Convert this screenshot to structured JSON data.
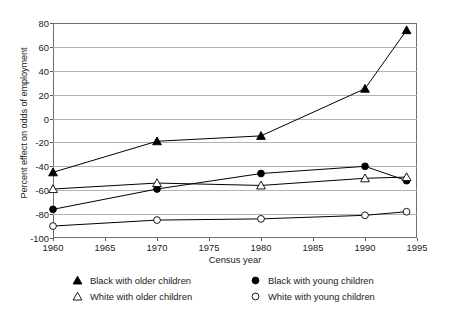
{
  "chart_data": {
    "type": "line",
    "title": "",
    "xlabel": "Census year",
    "ylabel": "Percent effect on odds of employment",
    "xlim": [
      1960,
      1995
    ],
    "ylim": [
      -100,
      80
    ],
    "xticks": [
      1960,
      1965,
      1970,
      1975,
      1980,
      1985,
      1990,
      1995
    ],
    "yticks": [
      80,
      60,
      40,
      20,
      0,
      -20,
      -40,
      -60,
      -80,
      -100
    ],
    "xtick_labels": [
      "1960",
      "1965",
      "1970",
      "1975",
      "1980",
      "1985",
      "1990",
      "1995"
    ],
    "ytick_labels": [
      "80",
      "60",
      "40",
      "20",
      "0",
      "-20",
      "-40",
      "-60",
      "-80",
      "-100"
    ],
    "grid": "horizontal",
    "legend_position": "below-axes",
    "x": [
      1960,
      1970,
      1980,
      1990,
      1994
    ],
    "series": [
      {
        "name": "Black with older children",
        "marker": "filled-triangle",
        "color": "#000000",
        "values": [
          -45,
          -19,
          -14.5,
          25,
          74
        ]
      },
      {
        "name": "Black with young children",
        "marker": "filled-circle",
        "color": "#000000",
        "values": [
          -76,
          -59,
          -46,
          -40,
          -52
        ]
      },
      {
        "name": "White with older children",
        "marker": "open-triangle",
        "color": "#000000",
        "values": [
          -59,
          -54,
          -56,
          -50,
          -49
        ]
      },
      {
        "name": "White with young children",
        "marker": "open-circle",
        "color": "#000000",
        "values": [
          -90,
          -85,
          -84,
          -81,
          -78
        ]
      }
    ]
  },
  "legend": {
    "entries": [
      {
        "label": "Black with older children",
        "marker": "filled-triangle"
      },
      {
        "label": "Black with young children",
        "marker": "filled-circle"
      },
      {
        "label": "White with older children",
        "marker": "open-triangle"
      },
      {
        "label": "White with young children",
        "marker": "open-circle"
      }
    ]
  },
  "colors": {
    "ink": "#000000",
    "gridline": "#b3b3b3",
    "frame": "#6f6f6f",
    "background": "#ffffff"
  }
}
